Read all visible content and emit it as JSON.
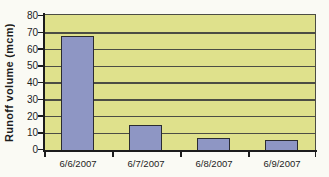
{
  "chart_data": {
    "type": "bar",
    "title": "",
    "categories": [
      "6/6/2007",
      "6/7/2007",
      "6/8/2007",
      "6/9/2007"
    ],
    "values": [
      68,
      15,
      7,
      6
    ],
    "xlabel": "",
    "ylabel": "Runoff volume (mcm)",
    "ylim": [
      0,
      80
    ],
    "yticks": [
      0,
      10,
      20,
      30,
      40,
      50,
      60,
      70,
      80
    ],
    "grid": "horizontal",
    "legend": "none",
    "colors": {
      "page_bg": "#fafaf4",
      "plot_bg": "#dfe18c",
      "bar_fill": "#8e96c4",
      "bar_border": "#2b2c31",
      "gridline": "#4c4d44",
      "axis": "#1c1c1c",
      "text": "#1d1d1d"
    }
  }
}
